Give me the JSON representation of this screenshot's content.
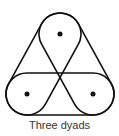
{
  "diagram": {
    "caption": "Three dyads",
    "nodes": [
      {
        "id": "top",
        "cx": 60,
        "cy": 34
      },
      {
        "id": "bottom-left",
        "cx": 27,
        "cy": 94
      },
      {
        "id": "bottom-right",
        "cx": 93,
        "cy": 94
      }
    ],
    "radius": 21,
    "dyads": [
      [
        "top",
        "bottom-left"
      ],
      [
        "top",
        "bottom-right"
      ],
      [
        "bottom-left",
        "bottom-right"
      ]
    ],
    "stroke_color": "#111111"
  }
}
